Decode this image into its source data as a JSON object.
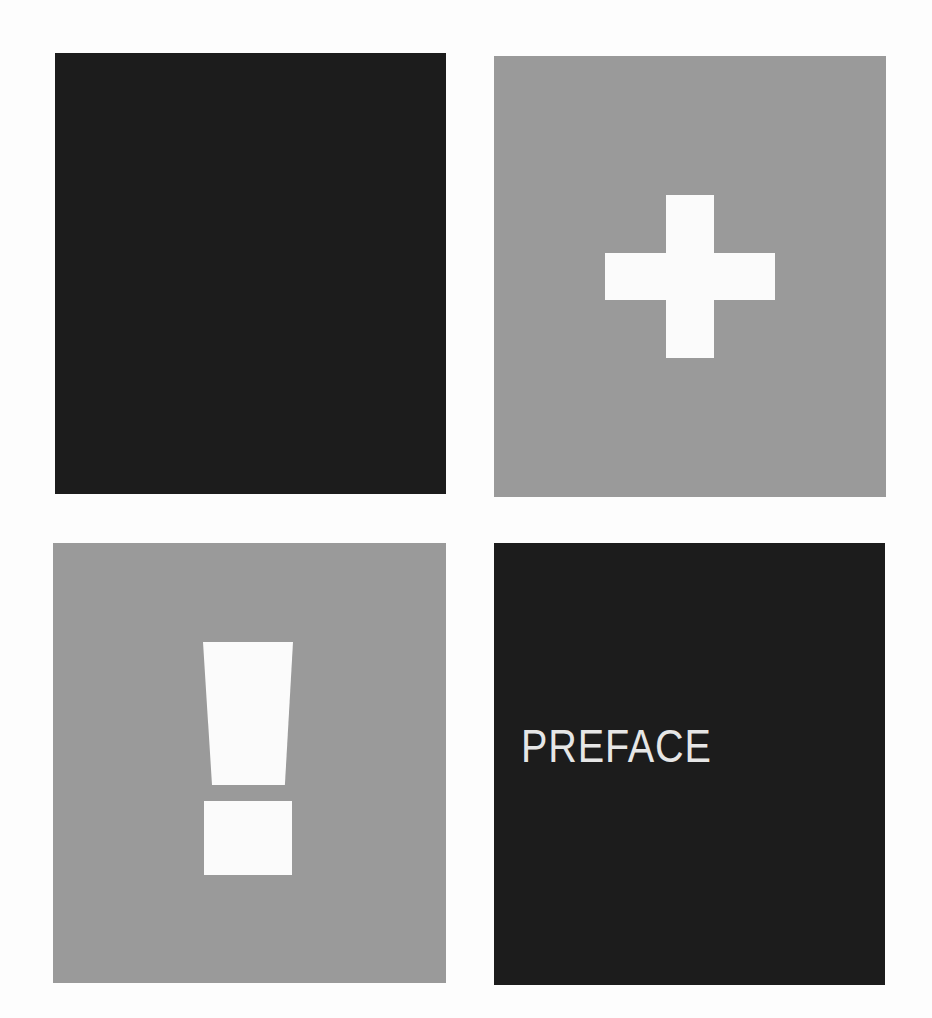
{
  "panels": {
    "top_left": {
      "style": "dark",
      "color": "#1c1c1c",
      "content": "empty"
    },
    "top_right": {
      "style": "gray",
      "color": "#9a9a9a",
      "icon": "plus-icon",
      "icon_color": "#fbfbfb"
    },
    "bottom_left": {
      "style": "gray",
      "color": "#9a9a9a",
      "icon": "exclamation-icon",
      "icon_color": "#fbfbfb"
    },
    "bottom_right": {
      "style": "dark",
      "color": "#1c1c1c",
      "text": "PREFACE",
      "text_color": "#e6e6e6"
    }
  },
  "page": {
    "background": "#fdfdfd"
  }
}
